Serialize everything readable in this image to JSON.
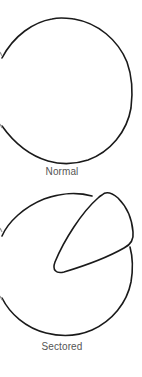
{
  "figure": {
    "panels": [
      {
        "id": "normal",
        "label": "Normal",
        "shape": "circle-outline"
      },
      {
        "id": "sectored",
        "label": "Sectored",
        "shape": "circle-outline-with-sector"
      }
    ],
    "colors": {
      "stroke": "#1a1a1a",
      "label": "#555555",
      "background": "#ffffff"
    }
  }
}
